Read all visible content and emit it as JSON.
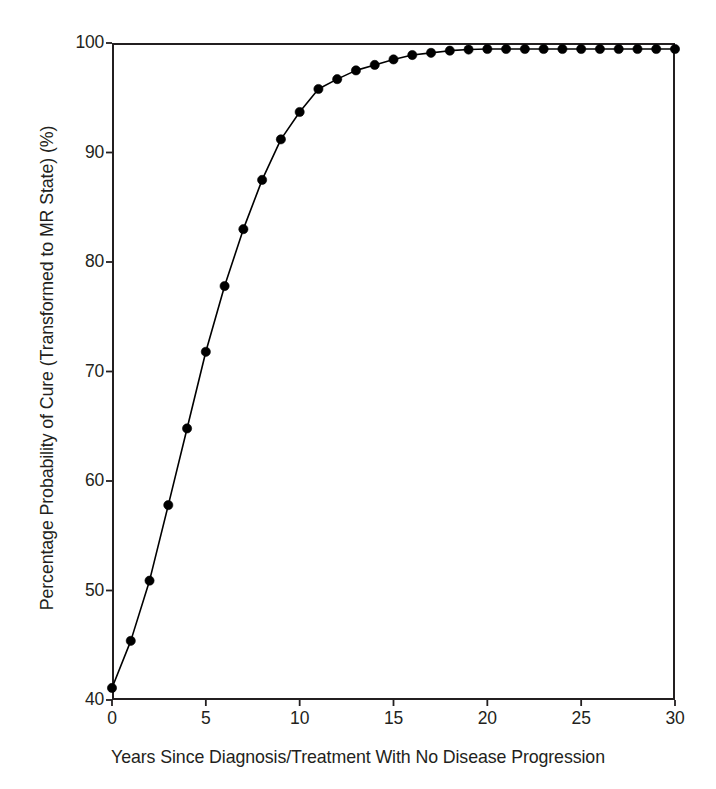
{
  "chart_data": {
    "type": "line",
    "title": "",
    "subtitle": "",
    "xlabel": "Years Since Diagnosis/Treatment With No Disease Progression",
    "ylabel": "Percentage Probability of Cure (Transformed to MR State) (%)",
    "xlim": [
      0,
      30
    ],
    "ylim": [
      40,
      100
    ],
    "xticks": [
      0,
      5,
      10,
      15,
      20,
      25,
      30
    ],
    "xtick_labels": [
      "0",
      "5",
      "10",
      "15",
      "20",
      "25",
      "30"
    ],
    "yticks": [
      40,
      50,
      60,
      70,
      80,
      90,
      100
    ],
    "ytick_labels": [
      "40",
      "50",
      "60",
      "70",
      "80",
      "90",
      "100"
    ],
    "grid": false,
    "legend": false,
    "legend_position": "none",
    "marker": "filled-circle",
    "marker_color": "#000000",
    "line_color": "#000000",
    "x": [
      0,
      1,
      2,
      3,
      4,
      5,
      6,
      7,
      8,
      9,
      10,
      11,
      12,
      13,
      14,
      15,
      16,
      17,
      18,
      19,
      20,
      21,
      22,
      23,
      24,
      25,
      26,
      27,
      28,
      29,
      30
    ],
    "values": [
      41.1,
      45.4,
      50.9,
      57.8,
      64.8,
      71.8,
      77.8,
      83.0,
      87.5,
      91.2,
      93.7,
      95.8,
      96.7,
      97.5,
      98.0,
      98.5,
      98.9,
      99.1,
      99.3,
      99.4,
      99.45,
      99.45,
      99.45,
      99.45,
      99.45,
      99.45,
      99.45,
      99.45,
      99.45,
      99.45,
      99.45
    ],
    "series": [
      {
        "name": "Probability of cure",
        "values": [
          41.1,
          45.4,
          50.9,
          57.8,
          64.8,
          71.8,
          77.8,
          83.0,
          87.5,
          91.2,
          93.7,
          95.8,
          96.7,
          97.5,
          98.0,
          98.5,
          98.9,
          99.1,
          99.3,
          99.4,
          99.45,
          99.45,
          99.45,
          99.45,
          99.45,
          99.45,
          99.45,
          99.45,
          99.45,
          99.45,
          99.45
        ]
      }
    ],
    "annotations": []
  },
  "figure": {
    "background_color": "#ffffff",
    "axis_color": "#231f20"
  }
}
